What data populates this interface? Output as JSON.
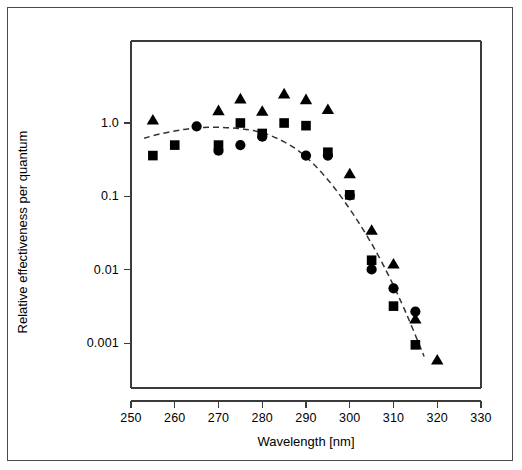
{
  "figure": {
    "kind": "scientific-action-spectrum",
    "background_color": "#ffffff",
    "border_color": "#4a4a4a",
    "marker_color": "#000000",
    "curve_color": "#333333"
  },
  "chart_data": {
    "type": "scatter",
    "title": "",
    "xlabel": "Wavelength [nm]",
    "ylabel": "Relative effectiveness per quantum",
    "xlim": [
      250,
      330
    ],
    "ylim": [
      0.0003,
      4
    ],
    "xscale": "linear",
    "yscale": "log",
    "grid": false,
    "legend": "none",
    "x_ticks": [
      250,
      260,
      270,
      280,
      290,
      300,
      310,
      320,
      330
    ],
    "x_tick_labels": [
      "250",
      "260",
      "270",
      "280",
      "290",
      "300",
      "310",
      "320",
      "330"
    ],
    "x_minor_ticks": [
      255,
      265,
      275,
      285,
      295,
      305,
      315,
      325
    ],
    "y_ticks": [
      1.0,
      0.1,
      0.01,
      0.001
    ],
    "y_tick_labels": [
      "1.0",
      "0.1",
      "0.01",
      "0.001"
    ],
    "series": [
      {
        "name": "triangle-series",
        "marker": "triangle",
        "color": "#000000",
        "points": [
          {
            "x": 255,
            "y": 1.08
          },
          {
            "x": 270,
            "y": 1.45
          },
          {
            "x": 275,
            "y": 2.1
          },
          {
            "x": 280,
            "y": 1.42
          },
          {
            "x": 285,
            "y": 2.45
          },
          {
            "x": 290,
            "y": 2.05
          },
          {
            "x": 295,
            "y": 1.5
          },
          {
            "x": 300,
            "y": 0.2
          },
          {
            "x": 305,
            "y": 0.034
          },
          {
            "x": 310,
            "y": 0.0118
          },
          {
            "x": 315,
            "y": 0.0021
          },
          {
            "x": 320,
            "y": 0.00058
          }
        ]
      },
      {
        "name": "square-series",
        "marker": "square",
        "color": "#000000",
        "points": [
          {
            "x": 255,
            "y": 0.36
          },
          {
            "x": 260,
            "y": 0.5
          },
          {
            "x": 270,
            "y": 0.5
          },
          {
            "x": 275,
            "y": 1.0
          },
          {
            "x": 280,
            "y": 0.72
          },
          {
            "x": 285,
            "y": 1.0
          },
          {
            "x": 290,
            "y": 0.92
          },
          {
            "x": 295,
            "y": 0.4
          },
          {
            "x": 300,
            "y": 0.105
          },
          {
            "x": 305,
            "y": 0.0135
          },
          {
            "x": 310,
            "y": 0.0032
          },
          {
            "x": 315,
            "y": 0.00095
          }
        ]
      },
      {
        "name": "circle-series",
        "marker": "circle",
        "color": "#000000",
        "points": [
          {
            "x": 265,
            "y": 0.9
          },
          {
            "x": 270,
            "y": 0.42
          },
          {
            "x": 275,
            "y": 0.5
          },
          {
            "x": 280,
            "y": 0.65
          },
          {
            "x": 290,
            "y": 0.36
          },
          {
            "x": 295,
            "y": 0.36
          },
          {
            "x": 300,
            "y": 0.103
          },
          {
            "x": 305,
            "y": 0.0101
          },
          {
            "x": 310,
            "y": 0.0056
          },
          {
            "x": 315,
            "y": 0.0027
          }
        ]
      }
    ],
    "fit_curve": {
      "name": "dashed-fit-curve",
      "style": "dashed",
      "color": "#333333",
      "points": [
        {
          "x": 253,
          "y": 0.62
        },
        {
          "x": 256,
          "y": 0.7
        },
        {
          "x": 260,
          "y": 0.78
        },
        {
          "x": 264,
          "y": 0.85
        },
        {
          "x": 268,
          "y": 0.88
        },
        {
          "x": 272,
          "y": 0.87
        },
        {
          "x": 276,
          "y": 0.83
        },
        {
          "x": 280,
          "y": 0.75
        },
        {
          "x": 284,
          "y": 0.6
        },
        {
          "x": 288,
          "y": 0.44
        },
        {
          "x": 292,
          "y": 0.27
        },
        {
          "x": 296,
          "y": 0.145
        },
        {
          "x": 300,
          "y": 0.068
        },
        {
          "x": 303,
          "y": 0.036
        },
        {
          "x": 306,
          "y": 0.018
        },
        {
          "x": 309,
          "y": 0.0082
        },
        {
          "x": 312,
          "y": 0.0034
        },
        {
          "x": 314,
          "y": 0.0018
        },
        {
          "x": 316,
          "y": 0.00092
        },
        {
          "x": 317,
          "y": 0.00066
        }
      ]
    }
  }
}
